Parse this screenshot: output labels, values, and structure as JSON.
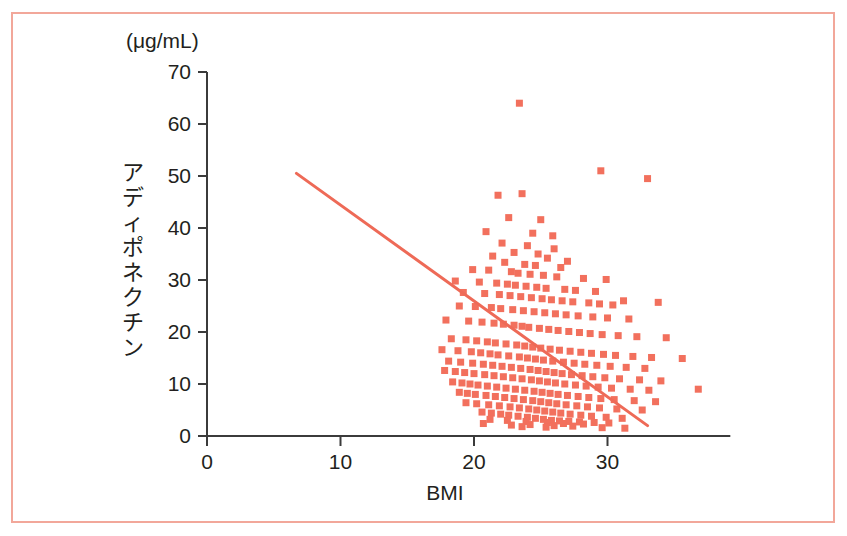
{
  "figure": {
    "frame_color": "#f2a79a",
    "background": "#ffffff",
    "axis_color": "#3b3b3b",
    "marker_color": "#f2705d",
    "line_color": "#ee6a57",
    "unit_label": "(μg/mL)",
    "y_axis_title": "アディポネクチン",
    "x_axis_title": "BMI"
  },
  "chart_data": {
    "type": "scatter",
    "title": "",
    "subtitle": "",
    "xlabel": "BMI",
    "ylabel": "アディポネクチン",
    "yunit": "(μg/mL)",
    "xlim": [
      0,
      39.2
    ],
    "ylim": [
      0,
      70
    ],
    "xticks": [
      0,
      10,
      20,
      30
    ],
    "yticks": [
      0,
      10,
      20,
      30,
      40,
      50,
      60,
      70
    ],
    "xticklabels": [
      "0",
      "10",
      "20",
      "30"
    ],
    "yticklabels": [
      "0",
      "10",
      "20",
      "30",
      "40",
      "50",
      "60",
      "70"
    ],
    "grid": false,
    "legend": false,
    "marker": "square",
    "marker_color": "#f2705d",
    "marker_size": 7,
    "trendline": {
      "type": "linear",
      "color": "#ee6a57",
      "width": 3,
      "x_start": 6.7,
      "y_start": 50.5,
      "x_end": 33.0,
      "y_end": 2.0,
      "slope": -1.845,
      "intercept": 62.86
    },
    "n_points": 438,
    "points": [
      [
        23.4,
        64.0
      ],
      [
        29.5,
        51.0
      ],
      [
        33.0,
        49.5
      ],
      [
        21.8,
        46.3
      ],
      [
        23.6,
        46.6
      ],
      [
        22.6,
        42.0
      ],
      [
        25.0,
        41.6
      ],
      [
        20.9,
        39.3
      ],
      [
        24.4,
        39.0
      ],
      [
        25.9,
        38.5
      ],
      [
        22.1,
        37.1
      ],
      [
        24.0,
        36.6
      ],
      [
        26.0,
        36.0
      ],
      [
        23.0,
        35.3
      ],
      [
        24.8,
        35.0
      ],
      [
        21.4,
        34.6
      ],
      [
        25.5,
        34.2
      ],
      [
        27.0,
        33.6
      ],
      [
        22.3,
        33.4
      ],
      [
        23.8,
        33.0
      ],
      [
        24.6,
        32.8
      ],
      [
        26.5,
        32.4
      ],
      [
        19.9,
        32.0
      ],
      [
        21.1,
        31.9
      ],
      [
        22.8,
        31.6
      ],
      [
        23.3,
        31.3
      ],
      [
        24.2,
        31.1
      ],
      [
        25.2,
        30.9
      ],
      [
        26.2,
        30.6
      ],
      [
        28.2,
        30.3
      ],
      [
        29.9,
        30.1
      ],
      [
        18.6,
        29.8
      ],
      [
        20.4,
        29.6
      ],
      [
        21.7,
        29.4
      ],
      [
        22.5,
        29.2
      ],
      [
        23.1,
        29.0
      ],
      [
        23.9,
        28.8
      ],
      [
        24.7,
        28.6
      ],
      [
        25.4,
        28.4
      ],
      [
        26.8,
        28.2
      ],
      [
        27.6,
        28.0
      ],
      [
        29.1,
        27.8
      ],
      [
        31.2,
        26.0
      ],
      [
        33.8,
        25.7
      ],
      [
        19.2,
        27.6
      ],
      [
        20.8,
        27.4
      ],
      [
        21.9,
        27.2
      ],
      [
        22.7,
        27.0
      ],
      [
        23.5,
        26.8
      ],
      [
        24.3,
        26.6
      ],
      [
        25.1,
        26.4
      ],
      [
        25.8,
        26.2
      ],
      [
        26.6,
        26.0
      ],
      [
        27.4,
        25.8
      ],
      [
        28.6,
        25.6
      ],
      [
        29.4,
        25.4
      ],
      [
        30.4,
        25.2
      ],
      [
        18.9,
        25.0
      ],
      [
        20.1,
        24.9
      ],
      [
        21.3,
        24.7
      ],
      [
        22.0,
        24.5
      ],
      [
        22.9,
        24.3
      ],
      [
        23.7,
        24.1
      ],
      [
        24.5,
        23.9
      ],
      [
        25.3,
        23.7
      ],
      [
        26.1,
        23.5
      ],
      [
        26.9,
        23.3
      ],
      [
        27.8,
        23.1
      ],
      [
        28.9,
        22.9
      ],
      [
        30.0,
        22.7
      ],
      [
        31.6,
        22.5
      ],
      [
        17.9,
        22.3
      ],
      [
        19.6,
        22.1
      ],
      [
        20.6,
        21.9
      ],
      [
        21.5,
        21.7
      ],
      [
        22.2,
        21.5
      ],
      [
        23.0,
        21.3
      ],
      [
        23.6,
        21.1
      ],
      [
        24.1,
        20.9
      ],
      [
        24.9,
        20.7
      ],
      [
        25.6,
        20.5
      ],
      [
        26.3,
        20.3
      ],
      [
        27.1,
        20.1
      ],
      [
        27.9,
        19.9
      ],
      [
        28.7,
        19.7
      ],
      [
        29.6,
        19.5
      ],
      [
        30.8,
        19.3
      ],
      [
        32.2,
        19.1
      ],
      [
        34.4,
        18.9
      ],
      [
        18.3,
        18.7
      ],
      [
        19.4,
        18.5
      ],
      [
        20.2,
        18.3
      ],
      [
        21.0,
        18.1
      ],
      [
        21.6,
        17.9
      ],
      [
        22.4,
        17.7
      ],
      [
        23.2,
        17.5
      ],
      [
        23.8,
        17.3
      ],
      [
        24.4,
        17.1
      ],
      [
        25.0,
        16.9
      ],
      [
        25.7,
        16.7
      ],
      [
        26.4,
        16.5
      ],
      [
        27.2,
        16.3
      ],
      [
        28.0,
        16.1
      ],
      [
        28.8,
        15.9
      ],
      [
        29.7,
        15.7
      ],
      [
        30.6,
        15.5
      ],
      [
        31.9,
        15.3
      ],
      [
        33.3,
        15.1
      ],
      [
        35.6,
        14.9
      ],
      [
        17.6,
        16.6
      ],
      [
        18.8,
        16.4
      ],
      [
        19.8,
        16.2
      ],
      [
        20.5,
        16.0
      ],
      [
        21.2,
        15.8
      ],
      [
        21.8,
        15.6
      ],
      [
        22.6,
        15.4
      ],
      [
        23.4,
        15.2
      ],
      [
        24.0,
        15.0
      ],
      [
        24.6,
        14.8
      ],
      [
        25.2,
        14.6
      ],
      [
        25.9,
        14.4
      ],
      [
        26.7,
        14.2
      ],
      [
        27.5,
        14.0
      ],
      [
        28.3,
        13.8
      ],
      [
        29.2,
        13.6
      ],
      [
        30.2,
        13.4
      ],
      [
        31.4,
        13.2
      ],
      [
        32.8,
        13.0
      ],
      [
        18.1,
        14.4
      ],
      [
        19.0,
        14.2
      ],
      [
        19.9,
        14.0
      ],
      [
        20.7,
        13.8
      ],
      [
        21.4,
        13.6
      ],
      [
        22.1,
        13.4
      ],
      [
        22.8,
        13.2
      ],
      [
        23.5,
        13.0
      ],
      [
        24.2,
        12.8
      ],
      [
        24.8,
        12.6
      ],
      [
        25.4,
        12.4
      ],
      [
        26.0,
        12.2
      ],
      [
        26.6,
        12.0
      ],
      [
        27.3,
        11.8
      ],
      [
        28.1,
        11.6
      ],
      [
        28.9,
        11.4
      ],
      [
        29.8,
        11.2
      ],
      [
        30.9,
        11.0
      ],
      [
        32.4,
        10.8
      ],
      [
        34.0,
        10.6
      ],
      [
        36.8,
        9.0
      ],
      [
        17.8,
        12.6
      ],
      [
        18.6,
        12.4
      ],
      [
        19.3,
        12.2
      ],
      [
        20.0,
        12.0
      ],
      [
        20.8,
        11.8
      ],
      [
        21.5,
        11.6
      ],
      [
        22.2,
        11.4
      ],
      [
        22.9,
        11.2
      ],
      [
        23.6,
        11.0
      ],
      [
        24.3,
        10.8
      ],
      [
        24.9,
        10.6
      ],
      [
        25.5,
        10.4
      ],
      [
        26.1,
        10.2
      ],
      [
        26.8,
        10.0
      ],
      [
        27.6,
        9.8
      ],
      [
        28.4,
        9.6
      ],
      [
        29.3,
        9.4
      ],
      [
        30.3,
        9.2
      ],
      [
        31.7,
        9.0
      ],
      [
        33.1,
        8.8
      ],
      [
        18.4,
        10.4
      ],
      [
        19.1,
        10.2
      ],
      [
        19.7,
        10.0
      ],
      [
        20.3,
        9.8
      ],
      [
        21.0,
        9.6
      ],
      [
        21.7,
        9.4
      ],
      [
        22.4,
        9.2
      ],
      [
        23.1,
        9.0
      ],
      [
        23.8,
        8.8
      ],
      [
        24.5,
        8.6
      ],
      [
        25.1,
        8.4
      ],
      [
        25.7,
        8.2
      ],
      [
        26.3,
        8.0
      ],
      [
        27.0,
        7.8
      ],
      [
        27.8,
        7.6
      ],
      [
        28.6,
        7.4
      ],
      [
        29.5,
        7.2
      ],
      [
        30.5,
        7.0
      ],
      [
        32.0,
        6.8
      ],
      [
        33.6,
        6.6
      ],
      [
        18.9,
        8.4
      ],
      [
        19.5,
        8.2
      ],
      [
        20.1,
        8.0
      ],
      [
        20.9,
        7.8
      ],
      [
        21.6,
        7.6
      ],
      [
        22.3,
        7.4
      ],
      [
        23.0,
        7.2
      ],
      [
        23.7,
        7.0
      ],
      [
        24.4,
        6.8
      ],
      [
        25.0,
        6.6
      ],
      [
        25.6,
        6.4
      ],
      [
        26.2,
        6.2
      ],
      [
        26.9,
        6.0
      ],
      [
        27.7,
        5.8
      ],
      [
        28.5,
        5.6
      ],
      [
        29.4,
        5.4
      ],
      [
        30.7,
        5.2
      ],
      [
        32.6,
        5.0
      ],
      [
        19.4,
        6.4
      ],
      [
        20.2,
        6.2
      ],
      [
        21.1,
        6.0
      ],
      [
        21.9,
        5.8
      ],
      [
        22.7,
        5.6
      ],
      [
        23.4,
        5.4
      ],
      [
        24.1,
        5.2
      ],
      [
        24.7,
        5.0
      ],
      [
        25.3,
        4.8
      ],
      [
        25.9,
        4.6
      ],
      [
        26.5,
        4.4
      ],
      [
        27.2,
        4.2
      ],
      [
        28.0,
        4.0
      ],
      [
        28.8,
        3.8
      ],
      [
        29.9,
        3.6
      ],
      [
        31.1,
        3.4
      ],
      [
        20.6,
        4.6
      ],
      [
        21.3,
        4.4
      ],
      [
        22.0,
        4.2
      ],
      [
        22.6,
        4.0
      ],
      [
        23.3,
        3.8
      ],
      [
        24.0,
        3.6
      ],
      [
        24.6,
        3.4
      ],
      [
        25.2,
        3.2
      ],
      [
        25.8,
        3.0
      ],
      [
        26.4,
        2.9
      ],
      [
        27.1,
        2.8
      ],
      [
        27.9,
        2.7
      ],
      [
        29.0,
        2.6
      ],
      [
        30.1,
        2.5
      ],
      [
        21.2,
        3.2
      ],
      [
        22.5,
        3.0
      ],
      [
        23.9,
        2.8
      ],
      [
        25.5,
        2.6
      ],
      [
        26.7,
        2.4
      ],
      [
        28.2,
        2.3
      ],
      [
        24.2,
        2.2
      ],
      [
        22.8,
        2.1
      ],
      [
        26.0,
        2.0
      ],
      [
        27.4,
        1.9
      ],
      [
        20.7,
        2.4
      ],
      [
        23.6,
        1.8
      ],
      [
        25.4,
        1.7
      ],
      [
        29.6,
        1.6
      ],
      [
        31.3,
        1.5
      ]
    ]
  }
}
